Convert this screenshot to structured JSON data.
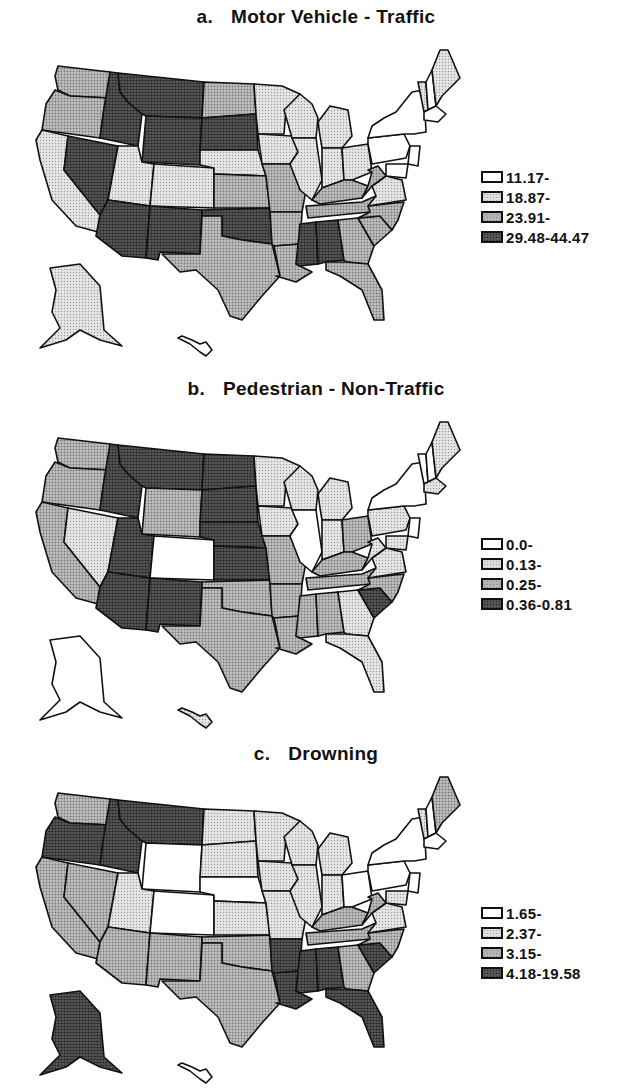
{
  "chart_data": [
    {
      "type": "choropleth",
      "panel": "a",
      "title": "Motor Vehicle - Traffic",
      "legend": [
        "11.17-",
        "18.87-",
        "23.91-",
        "29.48-44.47"
      ],
      "classes": {
        "WA": 2,
        "OR": 2,
        "CA": 1,
        "NV": 3,
        "ID": 3,
        "MT": 3,
        "WY": 3,
        "UT": 1,
        "CO": 1,
        "AZ": 3,
        "NM": 3,
        "ND": 2,
        "SD": 3,
        "NE": 1,
        "KS": 2,
        "OK": 3,
        "TX": 2,
        "MN": 1,
        "IA": 1,
        "MO": 2,
        "AR": 2,
        "LA": 2,
        "WI": 1,
        "IL": 1,
        "MI": 1,
        "IN": 1,
        "OH": 1,
        "KY": 2,
        "TN": 2,
        "MS": 3,
        "AL": 3,
        "GA": 2,
        "FL": 2,
        "SC": 2,
        "NC": 2,
        "VA": 1,
        "WV": 2,
        "PA": 0,
        "NY": 0,
        "VT": 1,
        "NH": 0,
        "ME": 1,
        "MA": 0,
        "NJ": 0,
        "MD": 0,
        "AK": 1,
        "HI": 0
      }
    },
    {
      "type": "choropleth",
      "panel": "b",
      "title": "Pedestrian - Non-Traffic",
      "legend": [
        "0.0-",
        "0.13-",
        "0.25-",
        "0.36-0.81"
      ],
      "classes": {
        "WA": 2,
        "OR": 2,
        "CA": 2,
        "NV": 1,
        "ID": 3,
        "MT": 3,
        "WY": 2,
        "UT": 3,
        "CO": 0,
        "AZ": 3,
        "NM": 3,
        "ND": 3,
        "SD": 3,
        "NE": 3,
        "KS": 3,
        "OK": 2,
        "TX": 2,
        "MN": 1,
        "IA": 1,
        "MO": 2,
        "AR": 2,
        "LA": 2,
        "WI": 1,
        "IL": 0,
        "MI": 1,
        "IN": 1,
        "OH": 2,
        "KY": 2,
        "TN": 2,
        "MS": 2,
        "AL": 2,
        "GA": 1,
        "FL": 1,
        "SC": 3,
        "NC": 2,
        "VA": 1,
        "WV": 1,
        "PA": 1,
        "NY": 0,
        "VT": 0,
        "NH": 0,
        "ME": 1,
        "MA": 1,
        "NJ": 0,
        "MD": 1,
        "AK": 0,
        "HI": 1
      }
    },
    {
      "type": "choropleth",
      "panel": "c",
      "title": "Drowning",
      "legend": [
        "1.65-",
        "2.37-",
        "3.15-",
        "4.18-19.58"
      ],
      "classes": {
        "WA": 2,
        "OR": 3,
        "CA": 2,
        "NV": 2,
        "ID": 3,
        "MT": 3,
        "WY": 0,
        "UT": 1,
        "CO": 0,
        "AZ": 2,
        "NM": 2,
        "ND": 1,
        "SD": 1,
        "NE": 0,
        "KS": 1,
        "OK": 2,
        "TX": 2,
        "MN": 1,
        "IA": 1,
        "MO": 1,
        "AR": 3,
        "LA": 3,
        "WI": 1,
        "IL": 1,
        "MI": 1,
        "IN": 1,
        "OH": 0,
        "KY": 2,
        "TN": 2,
        "MS": 3,
        "AL": 3,
        "GA": 2,
        "FL": 3,
        "SC": 3,
        "NC": 2,
        "VA": 1,
        "WV": 2,
        "PA": 0,
        "NY": 0,
        "VT": 1,
        "NH": 0,
        "ME": 2,
        "MA": 0,
        "NJ": 0,
        "MD": 1,
        "AK": 3,
        "HI": 0
      }
    }
  ],
  "panels": [
    {
      "letter": "a.",
      "title": "Motor Vehicle  -  Traffic",
      "legend": [
        "11.17-",
        "18.87-",
        "23.91-",
        "29.48-44.47"
      ]
    },
    {
      "letter": "b.",
      "title": "Pedestrian  -  Non-Traffic",
      "legend": [
        "0.0-",
        "0.13-",
        "0.25-",
        "0.36-0.81"
      ]
    },
    {
      "letter": "c.",
      "title": "Drowning",
      "legend": [
        "1.65-",
        "2.37-",
        "3.15-",
        "4.18-19.58"
      ]
    }
  ]
}
